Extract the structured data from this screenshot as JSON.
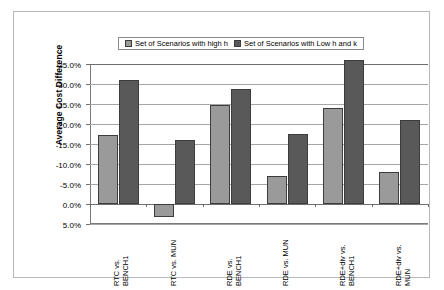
{
  "chart_data": {
    "type": "bar",
    "title": "",
    "xlabel": "",
    "ylabel": "Average Cost Difference",
    "categories": [
      "RTC vs.\nBENCH1",
      "RTC vs. MUN",
      "RDE vs.\nBENCH1",
      "RDE vs. MUN",
      "RDE+div vs.\nBENCH1",
      "RDE+div vs.\nMUN"
    ],
    "series": [
      {
        "name": "Set of Scenarios with high h",
        "color": "#9a9a9a",
        "values": [
          -17.3,
          3.3,
          -24.7,
          -7.0,
          -24.0,
          -8.0
        ]
      },
      {
        "name": "Set of Scenarios with Low h and k",
        "color": "#595959",
        "values": [
          -31.0,
          -16.0,
          -28.7,
          -17.5,
          -36.0,
          -21.0
        ]
      }
    ],
    "ylim": [
      5.0,
      -35.0
    ],
    "y_axis_inverted": true,
    "ytick_values": [
      -35.0,
      -30.0,
      -25.0,
      -20.0,
      -15.0,
      -10.0,
      -5.0,
      0.0,
      5.0
    ],
    "ytick_labels": [
      "-35.0%",
      "-30.0%",
      "-25.0%",
      "-20.0%",
      "-15.0%",
      "-10.0%",
      "-5.0%",
      "0.0%",
      "5.0%"
    ],
    "grid": true,
    "legend_position": "top-center"
  },
  "legend": {
    "entries": [
      {
        "label": "Set of Scenarios with high h"
      },
      {
        "label": "Set of Scenarios with Low h and k"
      }
    ]
  },
  "axes": {
    "y_title": "Average Cost Difference"
  }
}
